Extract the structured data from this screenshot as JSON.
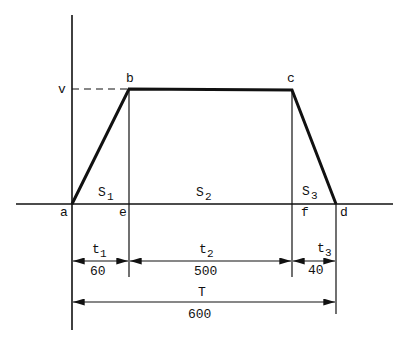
{
  "diagram": {
    "type": "velocity-time trapezoid",
    "axes": {
      "y_label": "v",
      "origin_label": "a"
    },
    "points": {
      "a": "a",
      "b": "b",
      "c": "c",
      "d": "d",
      "e": "e",
      "f": "f"
    },
    "areas": [
      {
        "name": "S",
        "sub": "1"
      },
      {
        "name": "S",
        "sub": "2"
      },
      {
        "name": "S",
        "sub": "3"
      }
    ],
    "intervals": [
      {
        "name": "t",
        "sub": "1",
        "value": "60"
      },
      {
        "name": "t",
        "sub": "2",
        "value": "500"
      },
      {
        "name": "t",
        "sub": "3",
        "value": "40"
      }
    ],
    "total": {
      "name": "T",
      "value": "600"
    }
  }
}
